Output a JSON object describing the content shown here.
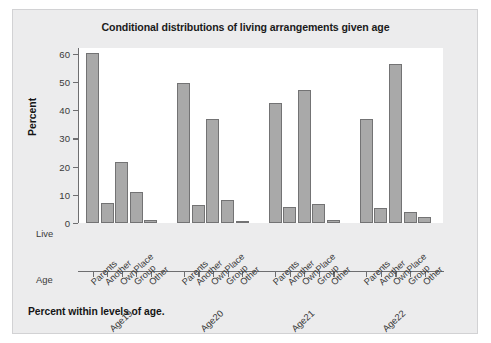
{
  "page": {
    "title": "Conditional distributions of living arrangements given age",
    "footnote": "Percent within levels of age.",
    "row_keys": {
      "live": "Live",
      "age": "Age"
    },
    "colors": {
      "page_background": "#ececed",
      "plot_background": "#ffffff",
      "bar_fill": "#a9a9a9",
      "bar_stroke": "#737374",
      "axis": "#6e6e70",
      "text": "#1b1b1b"
    }
  },
  "chart_data": {
    "type": "bar",
    "title": "Conditional distributions of living arrangements given age",
    "xlabel": "",
    "ylabel": "Percent",
    "ylim": [
      0,
      62
    ],
    "yticks": [
      0,
      10,
      20,
      30,
      40,
      50,
      60
    ],
    "grid": false,
    "legend": "none",
    "categories": [
      "Parents",
      "Another",
      "OwnPlace",
      "Group",
      "Other"
    ],
    "groups": [
      "Age19",
      "Age20",
      "Age21",
      "Age22"
    ],
    "series": [
      {
        "name": "Age19",
        "values": [
          60.3,
          7.2,
          21.7,
          11.0,
          1.2
        ]
      },
      {
        "name": "Age20",
        "values": [
          49.6,
          6.5,
          36.7,
          8.3,
          0.5
        ]
      },
      {
        "name": "Age21",
        "values": [
          42.5,
          5.7,
          47.0,
          6.8,
          1.0
        ]
      },
      {
        "name": "Age22",
        "values": [
          37.0,
          5.3,
          56.5,
          3.8,
          2.0
        ]
      }
    ]
  }
}
